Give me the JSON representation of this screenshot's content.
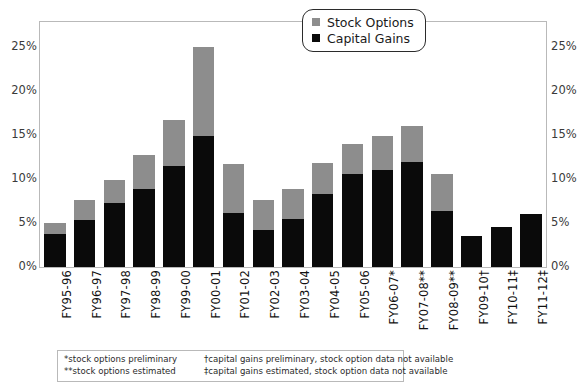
{
  "chart_data": {
    "type": "bar",
    "title": "",
    "subtitle": "",
    "xlabel": "",
    "ylabel": "",
    "stacked": true,
    "grid": false,
    "legend_position": "top-right",
    "ylim": [
      0,
      27.8
    ],
    "yticks": [
      0,
      5,
      10,
      15,
      20,
      25
    ],
    "ytick_labels": [
      "0%",
      "5%",
      "10%",
      "15%",
      "20%",
      "25%"
    ],
    "ytick_labels_right": [
      "0%",
      "5%",
      "10%",
      "15%",
      "20%",
      "25%"
    ],
    "categories": [
      "FY95-96",
      "FY96-97",
      "FY97-98",
      "FY98-99",
      "FY99-00",
      "FY00-01",
      "FY01-02",
      "FY02-03",
      "FY03-04",
      "FY04-05",
      "FY05-06",
      "FY06-07*",
      "FY07-08**",
      "FY08-09**",
      "FY09-10†",
      "FY10-11‡",
      "FY11-12‡"
    ],
    "series": [
      {
        "name": "Capital Gains",
        "color": "#0a0a0a",
        "values": [
          3.7,
          5.3,
          7.3,
          8.8,
          11.5,
          14.9,
          6.1,
          4.2,
          5.4,
          8.3,
          10.6,
          11.0,
          11.9,
          6.3,
          3.5,
          4.5,
          6.0
        ]
      },
      {
        "name": "Stock Options",
        "color": "#8d8d8d",
        "values": [
          1.3,
          2.3,
          2.6,
          3.9,
          5.2,
          10.1,
          5.6,
          3.4,
          3.4,
          3.5,
          3.4,
          3.9,
          4.1,
          4.3,
          0,
          0,
          0
        ]
      }
    ],
    "totals": [
      5.0,
      7.6,
      9.9,
      12.7,
      16.7,
      25.0,
      11.7,
      7.6,
      8.8,
      11.8,
      14.0,
      14.9,
      16.0,
      10.6,
      3.5,
      4.5,
      6.0
    ]
  },
  "legend": {
    "items": [
      {
        "label": "Stock Options",
        "swatch": "gray"
      },
      {
        "label": "Capital Gains",
        "swatch": "black"
      }
    ]
  },
  "footnote": {
    "rows": [
      {
        "left": "*stock options preliminary",
        "right": "†capital gains preliminary, stock option data not available"
      },
      {
        "left": "**stock options estimated",
        "right": "‡capital gains estimated, stock option data not available"
      }
    ]
  }
}
